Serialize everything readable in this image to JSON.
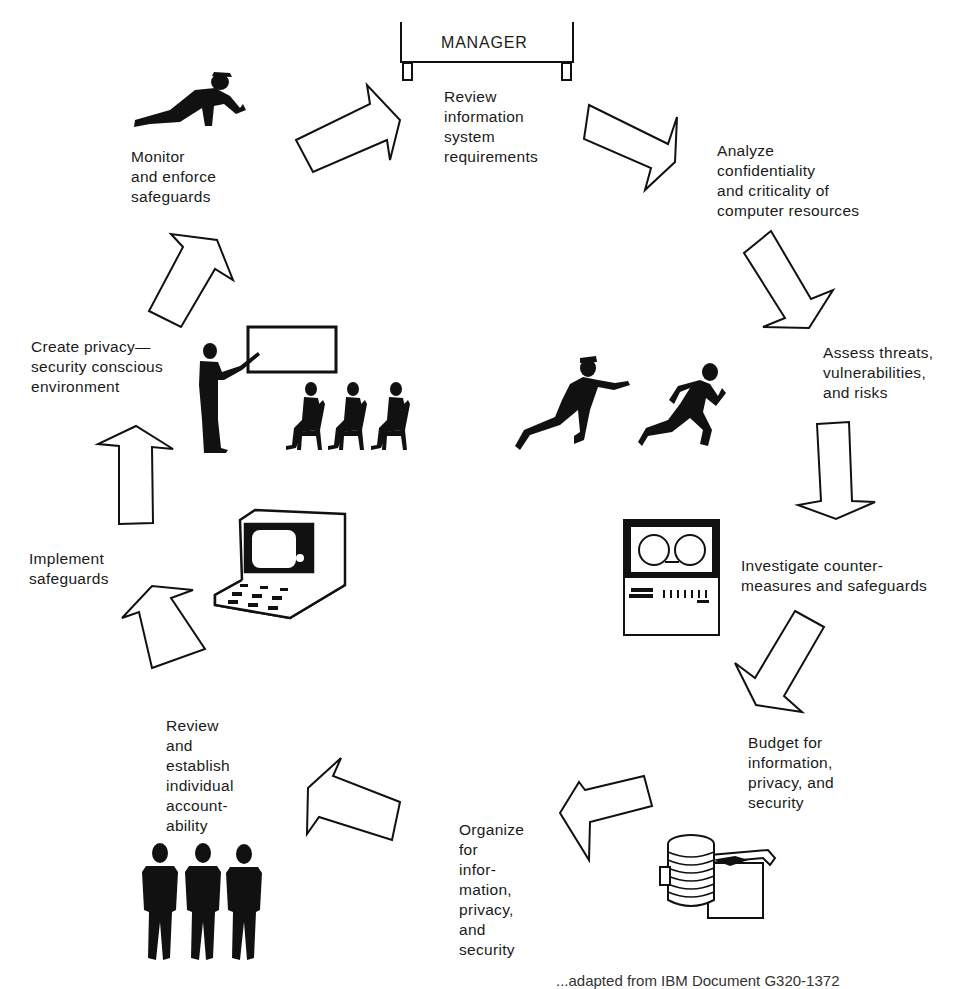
{
  "diagram": {
    "type": "cycle",
    "center_box": "MANAGER",
    "steps": [
      {
        "id": "review-requirements",
        "label": "Review\ninformation\nsystem\nrequirements"
      },
      {
        "id": "analyze-confidentiality",
        "label": "Analyze\nconfidentiality\nand criticality of\ncomputer resources"
      },
      {
        "id": "assess-threats",
        "label": "Assess threats,\nvulnerabilities,\nand risks"
      },
      {
        "id": "investigate-countermeasures",
        "label": "Investigate counter-\nmeasures and safeguards"
      },
      {
        "id": "budget",
        "label": "Budget for\ninformation,\nprivacy, and\nsecurity"
      },
      {
        "id": "organize",
        "label": "Organize\nfor\ninfor-\nmation,\nprivacy,\nand\nsecurity"
      },
      {
        "id": "review-accountability",
        "label": "Review\nand\nestablish\nindividual\naccount-\nability"
      },
      {
        "id": "implement-safeguards",
        "label": "Implement\nsafeguards"
      },
      {
        "id": "create-environment",
        "label": "Create privacy—\nsecurity conscious\nenvironment"
      },
      {
        "id": "monitor-enforce",
        "label": "Monitor\nand enforce\nsafeguards"
      }
    ],
    "illustrations": [
      "crawling-inspector-icon",
      "policeman-chasing-thief-icon",
      "tape-drive-icon",
      "coins-and-cash-icon",
      "three-standing-people-icon",
      "computer-terminal-icon",
      "presenter-with-audience-icon"
    ],
    "caption_partial": "...adapted from IBM Document G320-1372"
  }
}
